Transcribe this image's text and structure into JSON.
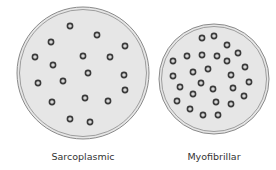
{
  "diagram": {
    "panels": [
      {
        "label": "Sarcoplasmic",
        "circle": {
          "cx": 83,
          "cy": 73,
          "r": 66
        },
        "dots": [
          [
            70,
            26
          ],
          [
            97,
            35
          ],
          [
            51,
            42
          ],
          [
            125,
            46
          ],
          [
            35,
            57
          ],
          [
            83,
            56
          ],
          [
            110,
            57
          ],
          [
            53,
            65
          ],
          [
            88,
            73
          ],
          [
            124,
            75
          ],
          [
            38,
            83
          ],
          [
            63,
            81
          ],
          [
            125,
            90
          ],
          [
            52,
            102
          ],
          [
            85,
            98
          ],
          [
            108,
            101
          ],
          [
            70,
            119
          ],
          [
            90,
            122
          ]
        ]
      },
      {
        "label": "Myofibrillar",
        "circle": {
          "cx": 214,
          "cy": 79,
          "r": 55
        },
        "dots": [
          [
            202,
            38
          ],
          [
            214,
            36
          ],
          [
            227,
            45
          ],
          [
            238,
            53
          ],
          [
            187,
            56
          ],
          [
            202,
            55
          ],
          [
            217,
            56
          ],
          [
            227,
            61
          ],
          [
            173,
            61
          ],
          [
            245,
            67
          ],
          [
            208,
            69
          ],
          [
            193,
            72
          ],
          [
            173,
            76
          ],
          [
            231,
            75
          ],
          [
            201,
            83
          ],
          [
            249,
            82
          ],
          [
            180,
            87
          ],
          [
            213,
            89
          ],
          [
            233,
            88
          ],
          [
            193,
            94
          ],
          [
            244,
            96
          ],
          [
            177,
            101
          ],
          [
            216,
            102
          ],
          [
            231,
            104
          ],
          [
            190,
            109
          ],
          [
            203,
            115
          ],
          [
            218,
            115
          ]
        ]
      }
    ],
    "colors": {
      "fill": "#e6e6e6",
      "outline": "#8a8a8a",
      "dot_ring": "#3a3a3a",
      "dot_center": "#d8d8d8",
      "text": "#333333"
    }
  }
}
